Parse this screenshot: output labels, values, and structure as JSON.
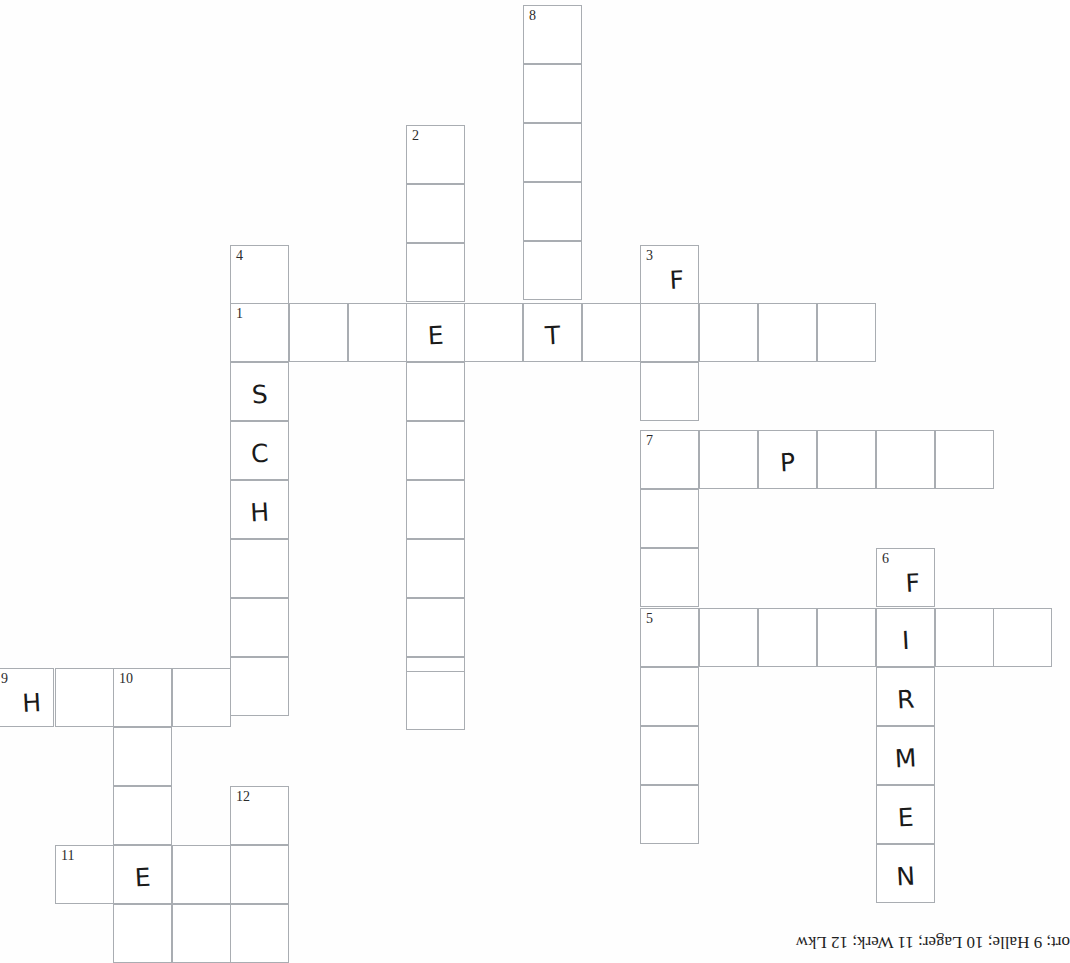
{
  "document": {
    "type": "crossword-puzzle-worksheet",
    "title": "Kreuzworträtsel",
    "footer_text": "ort; 9 Halle; 10 Lager; 11 Werk; 12 Lkw",
    "grid_cell_size": 59,
    "ink_color": "#1a1a1a",
    "grid_line_color": "#a9adb2",
    "paper_color": "#ffffff"
  },
  "grid": {
    "columns_px": [
      -5,
      55,
      113,
      172,
      230,
      289,
      406,
      464,
      523,
      582,
      640,
      699,
      758,
      817,
      876,
      935,
      993
    ],
    "entries": [
      {
        "number": "1",
        "direction": "across",
        "x": 230,
        "y": 303,
        "length": 11,
        "letters": [
          "",
          "",
          "",
          "E",
          "",
          "T",
          "",
          "",
          "",
          "",
          ""
        ]
      },
      {
        "number": "2",
        "direction": "down",
        "x": 406,
        "y": 125,
        "length": 10,
        "letters": [
          "",
          "",
          "",
          "E",
          "",
          "",
          "",
          "",
          "",
          ""
        ]
      },
      {
        "number": "3",
        "direction": "down",
        "x": 640,
        "y": 245,
        "length": 10,
        "letters": [
          "F",
          "",
          "",
          "",
          "",
          "",
          "",
          "",
          "",
          "D"
        ]
      },
      {
        "number": "4",
        "direction": "down",
        "x": 230,
        "y": 245,
        "length": 8,
        "letters": [
          "",
          "",
          "S",
          "C",
          "H",
          "",
          "",
          ""
        ]
      },
      {
        "number": "5",
        "direction": "across",
        "x": 640,
        "y": 608,
        "length": 7,
        "letters": [
          "",
          "",
          "",
          "",
          "I",
          "",
          ""
        ]
      },
      {
        "number": "6",
        "direction": "down",
        "x": 876,
        "y": 548,
        "length": 6,
        "letters": [
          "F",
          "I",
          "R",
          "M",
          "E",
          "N"
        ]
      },
      {
        "number": "7",
        "direction": "across",
        "x": 640,
        "y": 430,
        "length": 6,
        "letters": [
          "",
          "",
          "P",
          "",
          "",
          ""
        ]
      },
      {
        "number": "8",
        "direction": "down",
        "x": 523,
        "y": 5,
        "length": 6,
        "letters": [
          "",
          "",
          "",
          "",
          "",
          "T"
        ]
      },
      {
        "number": "9",
        "direction": "across",
        "x": -5,
        "y": 668,
        "length": 5,
        "letters": [
          "H",
          "",
          "",
          "",
          ""
        ]
      },
      {
        "number": "10",
        "direction": "down",
        "x": 113,
        "y": 668,
        "length": 6,
        "letters": [
          "",
          "",
          "",
          "E",
          "",
          ""
        ]
      },
      {
        "number": "11",
        "direction": "across",
        "x": 55,
        "y": 845,
        "length": 4,
        "letters": [
          "",
          "E",
          "",
          ""
        ]
      },
      {
        "number": "12",
        "direction": "down",
        "x": 230,
        "y": 786,
        "length": 4,
        "letters": [
          "",
          "",
          "",
          ""
        ]
      }
    ],
    "cells": [
      {
        "x": 523,
        "y": 5,
        "num": "8",
        "letter": ""
      },
      {
        "x": 523,
        "y": 64,
        "num": "",
        "letter": ""
      },
      {
        "x": 523,
        "y": 123,
        "num": "",
        "letter": ""
      },
      {
        "x": 523,
        "y": 182,
        "num": "",
        "letter": ""
      },
      {
        "x": 523,
        "y": 241,
        "num": "",
        "letter": ""
      },
      {
        "x": 406,
        "y": 125,
        "num": "2",
        "letter": ""
      },
      {
        "x": 406,
        "y": 184,
        "num": "",
        "letter": ""
      },
      {
        "x": 406,
        "y": 243,
        "num": "",
        "letter": ""
      },
      {
        "x": 230,
        "y": 245,
        "num": "4",
        "letter": ""
      },
      {
        "x": 640,
        "y": 245,
        "num": "3",
        "letter": "F"
      },
      {
        "x": 230,
        "y": 303,
        "num": "1",
        "letter": ""
      },
      {
        "x": 289,
        "y": 303,
        "num": "",
        "letter": ""
      },
      {
        "x": 348,
        "y": 303,
        "num": "",
        "letter": ""
      },
      {
        "x": 406,
        "y": 303,
        "num": "",
        "letter": "E"
      },
      {
        "x": 464,
        "y": 303,
        "num": "",
        "letter": ""
      },
      {
        "x": 523,
        "y": 303,
        "num": "",
        "letter": "T"
      },
      {
        "x": 582,
        "y": 303,
        "num": "",
        "letter": ""
      },
      {
        "x": 640,
        "y": 303,
        "num": "",
        "letter": ""
      },
      {
        "x": 699,
        "y": 303,
        "num": "",
        "letter": ""
      },
      {
        "x": 758,
        "y": 303,
        "num": "",
        "letter": ""
      },
      {
        "x": 817,
        "y": 303,
        "num": "",
        "letter": ""
      },
      {
        "x": 230,
        "y": 362,
        "num": "",
        "letter": "S"
      },
      {
        "x": 406,
        "y": 362,
        "num": "",
        "letter": ""
      },
      {
        "x": 640,
        "y": 362,
        "num": "",
        "letter": ""
      },
      {
        "x": 230,
        "y": 421,
        "num": "",
        "letter": "C"
      },
      {
        "x": 406,
        "y": 421,
        "num": "",
        "letter": ""
      },
      {
        "x": 640,
        "y": 430,
        "num": "7",
        "letter": ""
      },
      {
        "x": 699,
        "y": 430,
        "num": "",
        "letter": ""
      },
      {
        "x": 758,
        "y": 430,
        "num": "",
        "letter": "P"
      },
      {
        "x": 817,
        "y": 430,
        "num": "",
        "letter": ""
      },
      {
        "x": 876,
        "y": 430,
        "num": "",
        "letter": ""
      },
      {
        "x": 935,
        "y": 430,
        "num": "",
        "letter": ""
      },
      {
        "x": 230,
        "y": 480,
        "num": "",
        "letter": "H"
      },
      {
        "x": 406,
        "y": 480,
        "num": "",
        "letter": ""
      },
      {
        "x": 640,
        "y": 489,
        "num": "",
        "letter": ""
      },
      {
        "x": 230,
        "y": 539,
        "num": "",
        "letter": ""
      },
      {
        "x": 406,
        "y": 539,
        "num": "",
        "letter": ""
      },
      {
        "x": 876,
        "y": 548,
        "num": "6",
        "letter": "F"
      },
      {
        "x": 640,
        "y": 548,
        "num": "",
        "letter": ""
      },
      {
        "x": 230,
        "y": 598,
        "num": "",
        "letter": ""
      },
      {
        "x": 406,
        "y": 598,
        "num": "",
        "letter": ""
      },
      {
        "x": 640,
        "y": 608,
        "num": "5",
        "letter": ""
      },
      {
        "x": 699,
        "y": 608,
        "num": "",
        "letter": ""
      },
      {
        "x": 758,
        "y": 608,
        "num": "",
        "letter": ""
      },
      {
        "x": 817,
        "y": 608,
        "num": "",
        "letter": ""
      },
      {
        "x": 876,
        "y": 608,
        "num": "",
        "letter": "I"
      },
      {
        "x": 935,
        "y": 608,
        "num": "",
        "letter": ""
      },
      {
        "x": 993,
        "y": 608,
        "num": "",
        "letter": ""
      },
      {
        "x": 230,
        "y": 657,
        "num": "",
        "letter": ""
      },
      {
        "x": 406,
        "y": 657,
        "num": "",
        "letter": ""
      },
      {
        "x": 640,
        "y": 667,
        "num": "",
        "letter": ""
      },
      {
        "x": 876,
        "y": 667,
        "num": "",
        "letter": "R"
      },
      {
        "x": -5,
        "y": 668,
        "num": "9",
        "letter": "H"
      },
      {
        "x": 55,
        "y": 668,
        "num": "",
        "letter": ""
      },
      {
        "x": 113,
        "y": 668,
        "num": "10",
        "letter": ""
      },
      {
        "x": 172,
        "y": 668,
        "num": "",
        "letter": ""
      },
      {
        "x": 406,
        "y": 671,
        "num": "",
        "letter": ""
      },
      {
        "x": 640,
        "y": 726,
        "num": "",
        "letter": ""
      },
      {
        "x": 876,
        "y": 726,
        "num": "",
        "letter": "M"
      },
      {
        "x": 113,
        "y": 727,
        "num": "",
        "letter": ""
      },
      {
        "x": 640,
        "y": 785,
        "num": "",
        "letter": ""
      },
      {
        "x": 876,
        "y": 785,
        "num": "",
        "letter": "E"
      },
      {
        "x": 113,
        "y": 786,
        "num": "",
        "letter": ""
      },
      {
        "x": 230,
        "y": 786,
        "num": "12",
        "letter": ""
      },
      {
        "x": 876,
        "y": 844,
        "num": "",
        "letter": "N"
      },
      {
        "x": 55,
        "y": 845,
        "num": "11",
        "letter": ""
      },
      {
        "x": 113,
        "y": 845,
        "num": "",
        "letter": "E"
      },
      {
        "x": 172,
        "y": 845,
        "num": "",
        "letter": ""
      },
      {
        "x": 230,
        "y": 845,
        "num": "",
        "letter": ""
      },
      {
        "x": 113,
        "y": 904,
        "num": "",
        "letter": ""
      },
      {
        "x": 172,
        "y": 904,
        "num": "",
        "letter": ""
      },
      {
        "x": 230,
        "y": 904,
        "num": "",
        "letter": ""
      }
    ]
  }
}
